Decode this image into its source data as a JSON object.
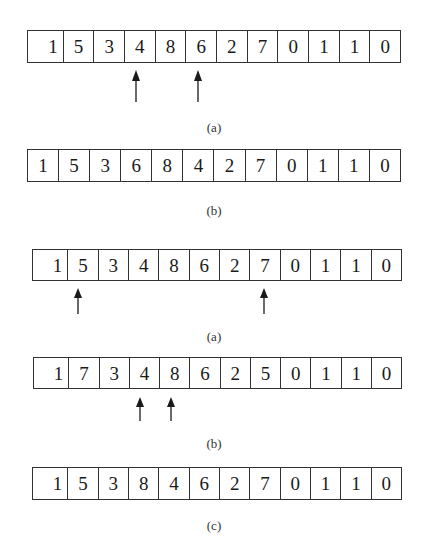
{
  "figure1": {
    "panels": [
      {
        "label": "(a)",
        "cells": [
          "1",
          "5",
          "3",
          "4",
          "8",
          "6",
          "2",
          "7",
          "0",
          "1",
          "1",
          "0"
        ],
        "arrows_at_indices": [
          3,
          5
        ]
      },
      {
        "label": "(b)",
        "cells": [
          "1",
          "5",
          "3",
          "6",
          "8",
          "4",
          "2",
          "7",
          "0",
          "1",
          "1",
          "0"
        ],
        "arrows_at_indices": []
      }
    ]
  },
  "figure2": {
    "panels": [
      {
        "label": "(a)",
        "cells": [
          "1",
          "5",
          "3",
          "4",
          "8",
          "6",
          "2",
          "7",
          "0",
          "1",
          "1",
          "0"
        ],
        "arrows_at_indices": [
          1,
          7
        ]
      },
      {
        "label": "(b)",
        "cells": [
          "1",
          "7",
          "3",
          "4",
          "8",
          "6",
          "2",
          "5",
          "0",
          "1",
          "1",
          "0"
        ],
        "arrows_at_indices": [
          3,
          4
        ]
      },
      {
        "label": "(c)",
        "cells": [
          "1",
          "5",
          "3",
          "8",
          "4",
          "6",
          "2",
          "7",
          "0",
          "1",
          "1",
          "0"
        ],
        "arrows_at_indices": []
      }
    ]
  },
  "colors": {
    "line": "#333333",
    "text": "#1a1a1a",
    "background": "#ffffff"
  }
}
